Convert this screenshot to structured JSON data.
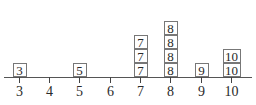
{
  "chart_data": {
    "type": "dot plot (stacked boxes)",
    "title": "",
    "xlabel": "",
    "ylabel": "",
    "categories": [
      "3",
      "4",
      "5",
      "6",
      "7",
      "8",
      "9",
      "10"
    ],
    "values": [
      1,
      0,
      1,
      0,
      3,
      4,
      1,
      2
    ],
    "data_points": [
      3,
      5,
      7,
      7,
      7,
      8,
      8,
      8,
      8,
      9,
      10,
      10
    ],
    "xlim": [
      3,
      10
    ],
    "grid": false,
    "legend": null
  },
  "axis": {
    "ticks": [
      {
        "label": "3",
        "x": 19
      },
      {
        "label": "4",
        "x": 49
      },
      {
        "label": "5",
        "x": 79
      },
      {
        "label": "6",
        "x": 110
      },
      {
        "label": "7",
        "x": 140
      },
      {
        "label": "8",
        "x": 170
      },
      {
        "label": "9",
        "x": 201
      },
      {
        "label": "10",
        "x": 231
      }
    ]
  },
  "colors": {
    "box_border": "#777777",
    "text": "#2a2a2a",
    "axis": "#555555"
  }
}
